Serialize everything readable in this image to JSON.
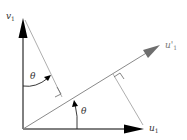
{
  "diagram": {
    "type": "vector-rotation-projection",
    "labels": {
      "v1": {
        "main": "v",
        "sub": "1"
      },
      "u1": {
        "main": "u",
        "sub": "1"
      },
      "u1_prime": {
        "main": "u'",
        "sub": "1"
      },
      "theta_upper": "θ",
      "theta_lower": "θ"
    },
    "colors": {
      "axis": "#000000",
      "rotated_vector": "#7a7a7a",
      "projection_lines": "#8a8a8a",
      "background": "#ffffff"
    }
  }
}
